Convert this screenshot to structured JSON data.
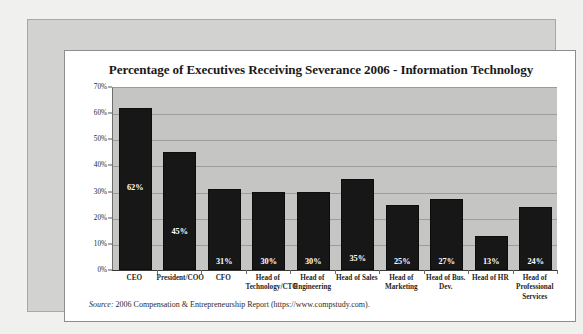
{
  "chart_data": {
    "type": "bar",
    "title": "Percentage of Executives Receiving Severance 2006 - Information Technology",
    "xlabel": "",
    "ylabel": "",
    "ylim": [
      0,
      70
    ],
    "grid": true,
    "legend": "none",
    "y_ticks": [
      "0%",
      "10%",
      "20%",
      "30%",
      "40%",
      "50%",
      "60%",
      "70%"
    ],
    "y_tick_values": [
      0,
      10,
      20,
      30,
      40,
      50,
      60,
      70
    ],
    "categories": [
      "CEO",
      "President/COO",
      "CFO",
      "Head of Technology/CTO",
      "Head of Engineering",
      "Head of Sales",
      "Head of Marketing",
      "Head of Bus. Dev.",
      "Head of HR",
      "Head of Professional Services"
    ],
    "category_lines": [
      [
        "CEO"
      ],
      [
        "President/COO"
      ],
      [
        "CFO"
      ],
      [
        "Head of",
        "Technology/CTO"
      ],
      [
        "Head of",
        "Engineering"
      ],
      [
        "Head of Sales"
      ],
      [
        "Head of",
        "Marketing"
      ],
      [
        "Head of Bus.",
        "Dev."
      ],
      [
        "Head of HR"
      ],
      [
        "Head of",
        "Professional",
        "Services"
      ]
    ],
    "values": [
      62,
      45,
      31,
      30,
      30,
      35,
      25,
      27,
      13,
      24
    ],
    "data_labels": [
      "62%",
      "45%",
      "31%",
      "30%",
      "30%",
      "35%",
      "25%",
      "27%",
      "13%",
      "24%"
    ],
    "bar_color": "#171717",
    "plot_background": "#c5c5c4",
    "gridline_color": "#9d9d9b",
    "data_label_color": "#ffffff"
  },
  "source": {
    "lead": "Source:",
    "text": " 2006 Compensation & Entrepreneurship Report (https://www.compstudy.com)."
  }
}
